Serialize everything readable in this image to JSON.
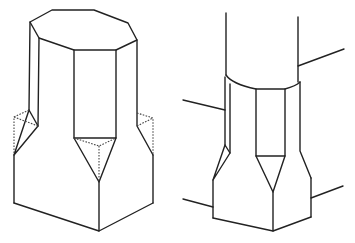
{
  "figure": {
    "title": "",
    "line_color": "#222222",
    "background": "#ffffff",
    "panels": [
      {
        "id": "left",
        "label": "",
        "description": "Isometric octagonal column transitioning to a square base via triangular chamfer stops, with hidden (dotted) construction edges of the square corners"
      },
      {
        "id": "right",
        "label": "",
        "description": "Round post set on an octagonal-to-square chamfered base, with beam/rail lines meeting the shaft and base"
      }
    ]
  }
}
